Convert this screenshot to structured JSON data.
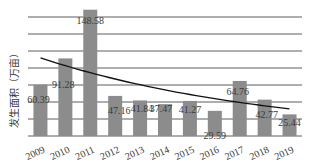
{
  "chart_data": {
    "type": "bar",
    "title": "",
    "xlabel": "",
    "ylabel": "发生面积（万亩）",
    "categories": [
      "2009",
      "2010",
      "2011",
      "2012",
      "2013",
      "2014",
      "2015",
      "2016",
      "2017",
      "2018",
      "2019"
    ],
    "values": [
      60.39,
      91.28,
      148.58,
      47.16,
      41.84,
      37.47,
      41.27,
      29.59,
      64.76,
      42.77,
      25.44
    ],
    "data_labels": [
      "60.39",
      "91.28",
      "148.58",
      "47.16",
      "41.84",
      "37.47",
      "41.27",
      "29.59",
      "64.76",
      "42.77",
      "25.44"
    ],
    "ylim": [
      0,
      160
    ],
    "grid": true,
    "grid_step": 20,
    "y_tick_labels_shown": false,
    "trendline": {
      "type": "exponential",
      "start_value": 92,
      "end_value": 32
    },
    "colors": {
      "bar": "#8c8c8c",
      "grid": "#333333",
      "trend": "#111111"
    }
  }
}
